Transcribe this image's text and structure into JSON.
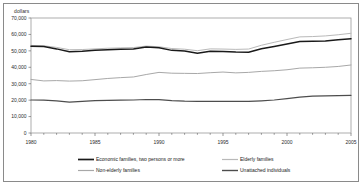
{
  "figure": {
    "y_axis_title": "dollars",
    "border_color": "#8a8a8a"
  },
  "legend": {
    "items": [
      {
        "label": "Economic families, two persons or more",
        "color": "#1a1a1a",
        "width": 1.5
      },
      {
        "label": "Elderly families",
        "color": "#b9b9b9",
        "width": 1.0
      },
      {
        "label": "Non-elderly families",
        "color": "#a8a8a8",
        "width": 1.0
      },
      {
        "label": "Unattached individuals",
        "color": "#4d4d4d",
        "width": 1.2
      }
    ]
  },
  "chart_data": {
    "type": "line",
    "title": "",
    "xlabel": "",
    "ylabel": "dollars",
    "xlim": [
      1980,
      2005
    ],
    "ylim": [
      0,
      70000
    ],
    "ytick_labels": [
      "70,000",
      "60,000",
      "50,000",
      "40,000",
      "30,000",
      "20,000",
      "10,000",
      "0"
    ],
    "yticks": [
      70000,
      60000,
      50000,
      40000,
      30000,
      20000,
      10000,
      0
    ],
    "xtick_labels": [
      "1980",
      "1985",
      "1990",
      "1995",
      "2000",
      "2005"
    ],
    "xticks": [
      1980,
      1985,
      1990,
      1995,
      2000,
      2005
    ],
    "grid": false,
    "legend_position": "bottom",
    "x": [
      1980,
      1981,
      1982,
      1983,
      1984,
      1985,
      1986,
      1987,
      1988,
      1989,
      1990,
      1991,
      1992,
      1993,
      1994,
      1995,
      1996,
      1997,
      1998,
      1999,
      2000,
      2001,
      2002,
      2003,
      2004,
      2005
    ],
    "series": [
      {
        "name": "Economic families, two persons or more",
        "color": "#1a1a1a",
        "values": [
          52800,
          52600,
          51200,
          49500,
          49700,
          50300,
          50700,
          51000,
          51200,
          52400,
          51900,
          50300,
          49900,
          48600,
          49700,
          49600,
          49300,
          49200,
          51300,
          52700,
          54200,
          55700,
          55900,
          56000,
          56700,
          57400
        ]
      },
      {
        "name": "Elderly families",
        "color": "#b9b9b9",
        "values": [
          53300,
          53100,
          52100,
          50700,
          50800,
          51200,
          51600,
          51800,
          52000,
          52900,
          52500,
          51400,
          51000,
          50100,
          51200,
          51100,
          50900,
          51100,
          53400,
          55200,
          56900,
          58500,
          58700,
          59100,
          59800,
          60700
        ]
      },
      {
        "name": "Non-elderly families",
        "color": "#a8a8a8",
        "values": [
          32600,
          31700,
          31900,
          31600,
          31800,
          32500,
          33200,
          33700,
          34100,
          35600,
          36900,
          36400,
          36300,
          36200,
          36700,
          37100,
          36600,
          36900,
          37500,
          37900,
          38500,
          39500,
          39700,
          40000,
          40500,
          41400
        ]
      },
      {
        "name": "Unattached individuals",
        "color": "#4d4d4d",
        "values": [
          20100,
          20000,
          19600,
          18800,
          19300,
          19700,
          19900,
          20000,
          20100,
          20400,
          20300,
          19700,
          19400,
          19300,
          19300,
          19300,
          19200,
          19200,
          19600,
          20100,
          20900,
          21800,
          22500,
          22600,
          22700,
          22900
        ]
      }
    ]
  }
}
